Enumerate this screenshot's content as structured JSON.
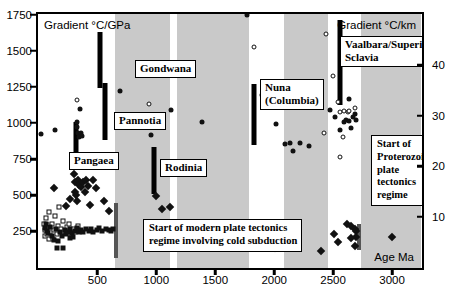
{
  "chart_data": {
    "type": "scatter",
    "title": "",
    "xlabel": "Age Ma",
    "ylabel": "Gradient °C/GPa",
    "ylabel_right": "Gradient °C/km",
    "xlim": [
      0,
      3250
    ],
    "ylim": [
      0,
      1750
    ],
    "y2lim": [
      0,
      50
    ],
    "xticks": [
      500,
      1000,
      1500,
      2000,
      2500,
      3000
    ],
    "yticks": [
      250,
      500,
      750,
      1000,
      1250,
      1500,
      1750
    ],
    "y2ticks": [
      10,
      20,
      30,
      40
    ],
    "grid": false,
    "legend": "none",
    "bands": [
      {
        "x0": 650,
        "x1": 1120,
        "color": "#c9c9c9"
      },
      {
        "x0": 1180,
        "x1": 1790,
        "color": "#c9c9c9"
      },
      {
        "x0": 2090,
        "x1": 2460,
        "color": "#c9c9c9"
      },
      {
        "x0": 2740,
        "x1": 3250,
        "color": "#c9c9c9"
      }
    ],
    "series": [
      {
        "name": "open squares",
        "marker": "open-square",
        "points": [
          [
            55,
            300
          ],
          [
            60,
            255
          ],
          [
            62,
            215
          ],
          [
            70,
            340
          ],
          [
            72,
            270
          ],
          [
            78,
            225
          ],
          [
            85,
            290
          ],
          [
            95,
            380
          ],
          [
            100,
            245
          ],
          [
            108,
            205
          ],
          [
            120,
            300
          ],
          [
            132,
            255
          ],
          [
            145,
            350
          ],
          [
            158,
            230
          ],
          [
            168,
            285
          ],
          [
            180,
            415
          ],
          [
            195,
            260
          ],
          [
            210,
            320
          ],
          [
            225,
            240
          ],
          [
            245,
            275
          ],
          [
            262,
            300
          ],
          [
            280,
            230
          ],
          [
            300,
            265
          ],
          [
            318,
            240
          ],
          [
            340,
            285
          ],
          [
            90,
            195
          ],
          [
            130,
            195
          ]
        ]
      },
      {
        "name": "filled squares",
        "marker": "filled-square",
        "points": [
          [
            58,
            270
          ],
          [
            66,
            300
          ],
          [
            75,
            250
          ],
          [
            88,
            235
          ],
          [
            105,
            280
          ],
          [
            118,
            215
          ],
          [
            138,
            185
          ],
          [
            150,
            260
          ],
          [
            172,
            180
          ],
          [
            190,
            245
          ],
          [
            205,
            215
          ],
          [
            228,
            255
          ],
          [
            240,
            225
          ],
          [
            258,
            245
          ],
          [
            275,
            260
          ],
          [
            292,
            235
          ],
          [
            310,
            250
          ],
          [
            328,
            270
          ],
          [
            348,
            245
          ],
          [
            365,
            255
          ],
          [
            385,
            240
          ],
          [
            405,
            265
          ],
          [
            430,
            250
          ],
          [
            452,
            260
          ],
          [
            470,
            245
          ],
          [
            498,
            255
          ],
          [
            520,
            270
          ],
          [
            545,
            250
          ],
          [
            575,
            260
          ],
          [
            600,
            255
          ],
          [
            620,
            250
          ],
          [
            640,
            265
          ],
          [
            158,
            130
          ],
          [
            215,
            128
          ],
          [
            272,
            200
          ],
          [
            300,
            205
          ]
        ]
      },
      {
        "name": "filled diamonds",
        "marker": "filled-diamond",
        "points": [
          [
            140,
            545
          ],
          [
            235,
            420
          ],
          [
            275,
            470
          ],
          [
            305,
            640
          ],
          [
            312,
            585
          ],
          [
            318,
            520
          ],
          [
            325,
            495
          ],
          [
            330,
            455
          ],
          [
            340,
            600
          ],
          [
            352,
            570
          ],
          [
            368,
            555
          ],
          [
            380,
            590
          ],
          [
            395,
            520
          ],
          [
            410,
            605
          ],
          [
            425,
            560
          ],
          [
            445,
            430
          ],
          [
            470,
            600
          ],
          [
            492,
            545
          ],
          [
            520,
            720
          ],
          [
            560,
            455
          ],
          [
            600,
            385
          ],
          [
            1000,
            490
          ],
          [
            1055,
            400
          ],
          [
            1120,
            415
          ],
          [
            1790,
            200
          ],
          [
            1845,
            200
          ],
          [
            1870,
            185
          ],
          [
            1905,
            165
          ],
          [
            1950,
            150
          ],
          [
            2010,
            130
          ],
          [
            2400,
            110
          ],
          [
            2510,
            225
          ],
          [
            2545,
            170
          ],
          [
            2620,
            300
          ],
          [
            2660,
            285
          ],
          [
            2690,
            265
          ],
          [
            2700,
            250
          ],
          [
            2700,
            210
          ],
          [
            2690,
            145
          ],
          [
            3000,
            205
          ],
          [
            2660,
            200
          ]
        ]
      },
      {
        "name": "filled circles",
        "marker": "filled-circle",
        "points": [
          [
            25,
            920
          ],
          [
            148,
            945
          ],
          [
            330,
            1000
          ],
          [
            335,
            965
          ],
          [
            340,
            930
          ],
          [
            345,
            900
          ],
          [
            355,
            1090
          ],
          [
            365,
            930
          ],
          [
            370,
            905
          ],
          [
            700,
            1220
          ],
          [
            960,
            915
          ],
          [
            1125,
            1085
          ],
          [
            1390,
            1000
          ],
          [
            1770,
            1740
          ],
          [
            1900,
            1190
          ],
          [
            2020,
            990
          ],
          [
            2100,
            850
          ],
          [
            2140,
            860
          ],
          [
            2160,
            805
          ],
          [
            2220,
            855
          ],
          [
            2300,
            835
          ],
          [
            2480,
            1085
          ],
          [
            2520,
            1040
          ],
          [
            2560,
            945
          ],
          [
            2600,
            1000
          ],
          [
            2610,
            1020
          ],
          [
            2640,
            1010
          ],
          [
            2660,
            960
          ],
          [
            2670,
            1035
          ],
          [
            2690,
            1060
          ],
          [
            2700,
            1015
          ],
          [
            3005,
            835
          ],
          [
            2640,
            1165
          ]
        ]
      },
      {
        "name": "open circles",
        "marker": "open-circle",
        "points": [
          [
            330,
            1155
          ],
          [
            940,
            1130
          ],
          [
            1830,
            1520
          ],
          [
            2445,
            1615
          ],
          [
            2505,
            1320
          ],
          [
            2545,
            1140
          ],
          [
            2560,
            1075
          ],
          [
            2600,
            1080
          ],
          [
            2630,
            1070
          ],
          [
            2640,
            1080
          ],
          [
            2585,
            900
          ],
          [
            2560,
            760
          ],
          [
            2690,
            1100
          ],
          [
            2430,
            925
          ]
        ]
      }
    ],
    "supercontinent_bars": [
      {
        "label": "Gondwana",
        "x": 530,
        "y_top": 1625,
        "y_bottom": 1240
      },
      {
        "label": "Pannotia",
        "x": 570,
        "y_top": 1275,
        "y_bottom": 880
      },
      {
        "label": "Pangaea",
        "x": 320,
        "y_top": 1000,
        "y_bottom": 760
      },
      {
        "label": "Rodinia",
        "x": 985,
        "y_top": 830,
        "y_bottom": 505
      },
      {
        "label": "Nuna (Columbia)",
        "x": 1830,
        "y_top": 1265,
        "y_bottom": 845
      },
      {
        "label": "Vaalbara/Superia/ Sclavia",
        "x": 2565,
        "y_top": 1710,
        "y_bottom": 1120
      }
    ],
    "event_bars": [
      {
        "name": "modern-plate-tectonics-marker",
        "x": 660,
        "y_top": 440,
        "y_bottom": 60,
        "color": "#555"
      },
      {
        "name": "proterozoic-plate-tectonics-marker",
        "x": 2725,
        "y_top": 300,
        "y_bottom": 120,
        "color": "#555"
      }
    ],
    "annotations": [
      {
        "name": "start-modern-plate-tectonics",
        "lines": [
          "Start of modern plate tectonics",
          "regime involving cold subduction"
        ]
      },
      {
        "name": "start-proterozoic-plate-tectonics",
        "lines": [
          "Start of",
          "Proterozoic",
          "plate",
          "tectonics",
          "regime"
        ]
      }
    ]
  },
  "labels": {
    "gondwana": "Gondwana",
    "pannotia": "Pannotia",
    "pangaea": "Pangaea",
    "rodinia": "Rodinia",
    "nuna_line1": "Nuna",
    "nuna_line2": "(Columbia)",
    "vaalbara_line1": "Vaalbara/Superia/",
    "vaalbara_line2": "Sclavia",
    "note_modern_line1": "Start of modern plate tectonics",
    "note_modern_line2": "regime involving cold subduction",
    "note_prot_line1": "Start of",
    "note_prot_line2": "Proterozoic",
    "note_prot_line3": "plate",
    "note_prot_line4": "tectonics",
    "note_prot_line5": "regime"
  },
  "axes": {
    "y_title": "Gradient °C/GPa",
    "y2_title": "Gradient °C/km",
    "x_title": "Age Ma",
    "yticks": [
      "250",
      "500",
      "750",
      "1000",
      "1250",
      "1500",
      "1750"
    ],
    "y2ticks": [
      "10",
      "20",
      "30",
      "40"
    ],
    "xticks": [
      "500",
      "1000",
      "1500",
      "2000",
      "2500",
      "3000"
    ]
  },
  "colors": {
    "band": "#c9c9c9",
    "frame": "#000000",
    "marker": "#111111",
    "event_bar": "#555555"
  }
}
